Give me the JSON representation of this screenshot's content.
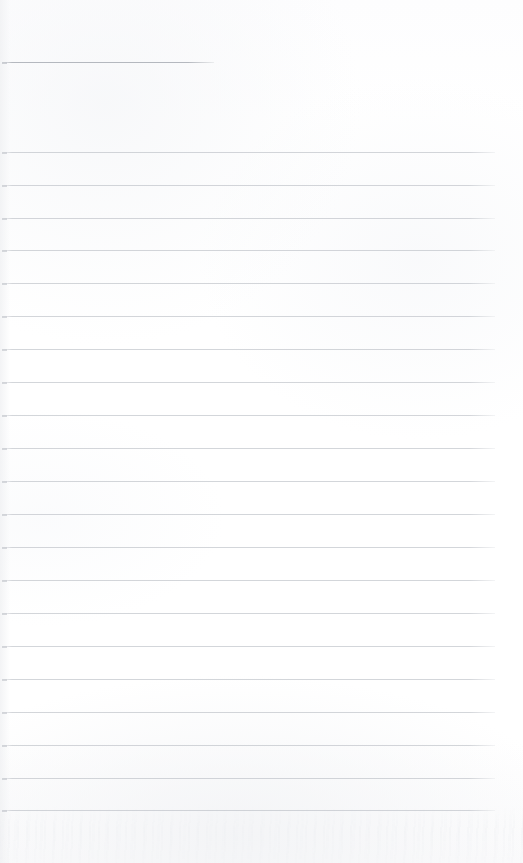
{
  "document": {
    "type": "lined-notebook-page",
    "title": "Lined notebook page",
    "state": "blank",
    "visible_text": "",
    "page_width": 523,
    "page_height": 863
  },
  "appearance": {
    "background_color": "#fefefe",
    "rule_color": "#b9bdc4",
    "header_rule_color": "#9ea3ab",
    "rule_opacity": 0.62,
    "rule_thickness_px": 1
  },
  "ruling": {
    "line_count": 22,
    "body_line_count": 21,
    "spacing_px": 32.9,
    "left_margin_px": 2,
    "right_margin_px": 28,
    "header_rule": {
      "name": "header-rule",
      "y": 62,
      "x_start": 2,
      "x_end": 214,
      "length_px": 212
    },
    "lines": [
      {
        "name": "header-rule",
        "y": 62,
        "x_start": 2,
        "x_end": 214,
        "short": true
      },
      {
        "name": "rule-1",
        "y": 152,
        "x_start": 2,
        "x_end": 495,
        "short": false
      },
      {
        "name": "rule-2",
        "y": 185,
        "x_start": 2,
        "x_end": 495,
        "short": false
      },
      {
        "name": "rule-3",
        "y": 218,
        "x_start": 2,
        "x_end": 495,
        "short": false
      },
      {
        "name": "rule-4",
        "y": 250,
        "x_start": 2,
        "x_end": 495,
        "short": false
      },
      {
        "name": "rule-5",
        "y": 283,
        "x_start": 2,
        "x_end": 495,
        "short": false
      },
      {
        "name": "rule-6",
        "y": 316,
        "x_start": 2,
        "x_end": 495,
        "short": false
      },
      {
        "name": "rule-7",
        "y": 349,
        "x_start": 2,
        "x_end": 495,
        "short": false
      },
      {
        "name": "rule-8",
        "y": 382,
        "x_start": 2,
        "x_end": 495,
        "short": false
      },
      {
        "name": "rule-9",
        "y": 415,
        "x_start": 2,
        "x_end": 495,
        "short": false
      },
      {
        "name": "rule-10",
        "y": 448,
        "x_start": 2,
        "x_end": 495,
        "short": false
      },
      {
        "name": "rule-11",
        "y": 481,
        "x_start": 2,
        "x_end": 495,
        "short": false
      },
      {
        "name": "rule-12",
        "y": 514,
        "x_start": 2,
        "x_end": 495,
        "short": false
      },
      {
        "name": "rule-13",
        "y": 547,
        "x_start": 2,
        "x_end": 495,
        "short": false
      },
      {
        "name": "rule-14",
        "y": 580,
        "x_start": 2,
        "x_end": 495,
        "short": false
      },
      {
        "name": "rule-15",
        "y": 613,
        "x_start": 2,
        "x_end": 495,
        "short": false
      },
      {
        "name": "rule-16",
        "y": 646,
        "x_start": 2,
        "x_end": 495,
        "short": false
      },
      {
        "name": "rule-17",
        "y": 679,
        "x_start": 2,
        "x_end": 495,
        "short": false
      },
      {
        "name": "rule-18",
        "y": 712,
        "x_start": 2,
        "x_end": 495,
        "short": false
      },
      {
        "name": "rule-19",
        "y": 745,
        "x_start": 2,
        "x_end": 495,
        "short": false
      },
      {
        "name": "rule-20",
        "y": 778,
        "x_start": 2,
        "x_end": 495,
        "short": false
      },
      {
        "name": "rule-21",
        "y": 810,
        "x_start": 2,
        "x_end": 495,
        "short": false
      }
    ]
  }
}
